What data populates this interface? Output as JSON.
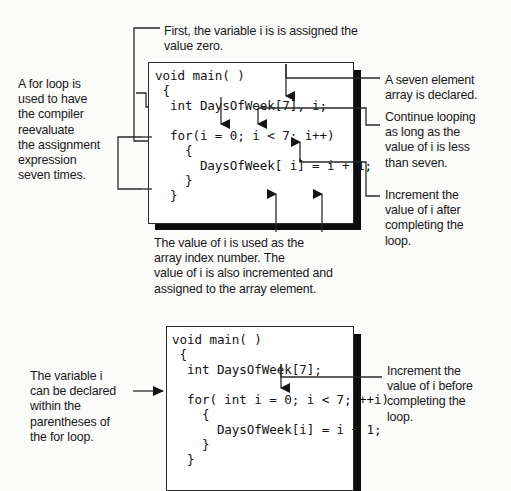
{
  "figure": {
    "background_color": "#fbfbfa",
    "line_color": "#2a2a2a",
    "shadow_color": "#0d0d0d",
    "box_fill": "#ffffff"
  },
  "diagram1": {
    "code_lines": [
      "void main( )",
      " {",
      "  int DaysOfWeek[7], i;",
      "",
      "  for(i = 0; i < 7; i++)",
      "    {",
      "      DaysOfWeek[ i] = i + 1;",
      "    }",
      "  }"
    ],
    "code_text": "void main( )\n {\n  int DaysOfWeek[7], i;\n\n  for(i = 0; i < 7; i++)\n    {\n      DaysOfWeek[ i] = i + 1;\n    }\n  }",
    "annotations": {
      "top": "First, the variable i is is assigned the\nvalue zero.",
      "left": "A for loop is\nused to have\nthe compiler\nreevaluate\nthe assignment\nexpression\nseven times.",
      "right_1": "A seven element\narray is declared.",
      "right_2": "Continue looping\nas long as the\nvalue of i is less\nthan seven.",
      "right_3": "Increment the\nvalue of i after\ncompleting the\nloop.",
      "bottom": "The value of i is used as the\narray index number. The\nvalue of i is also incremented and\nassigned to the array element."
    }
  },
  "diagram2": {
    "code_lines": [
      "void main( )",
      " {",
      "  int DaysOfWeek[7];",
      "",
      "  for( int i = 0; i < 7; ++i)",
      "    {",
      "      DaysOfWeek[i] = i + 1;",
      "    }",
      "  }"
    ],
    "code_text": "void main( )\n {\n  int DaysOfWeek[7];\n\n  for( int i = 0; i < 7; ++i)\n    {\n      DaysOfWeek[i] = i + 1;\n    }\n  }",
    "annotations": {
      "left": "The variable i\ncan be declared\nwithin the\nparentheses of\nthe for loop.",
      "right": "Increment the\nvalue of i before\ncompleting the\nloop."
    }
  }
}
